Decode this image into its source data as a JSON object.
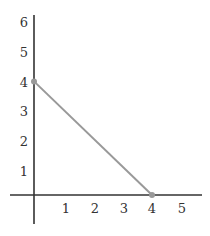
{
  "chart_data": {
    "type": "line",
    "title": "",
    "xlabel": "",
    "ylabel": "",
    "x_ticks": [
      "1",
      "2",
      "3",
      "4",
      "5"
    ],
    "y_ticks": [
      "1",
      "2",
      "3",
      "4",
      "5",
      "6"
    ],
    "xlim": [
      0,
      5.5
    ],
    "ylim": [
      0,
      6.2
    ],
    "grid": false,
    "legend": null,
    "series": [
      {
        "name": "line",
        "points": [
          [
            0,
            4
          ],
          [
            4,
            0
          ]
        ],
        "color": "#999999",
        "markers": true
      }
    ]
  },
  "colors": {
    "axis": "#333333",
    "line": "#999999",
    "marker": "#999999"
  }
}
